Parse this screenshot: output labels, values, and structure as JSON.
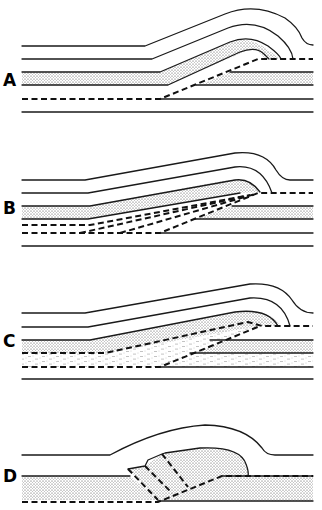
{
  "figure": {
    "type": "geological cross-section diagram",
    "panels": [
      {
        "id": "A",
        "label": "A",
        "description": "Fault-bend fold: stippled bed folded over a single ramp thrust (dashed)"
      },
      {
        "id": "B",
        "label": "B",
        "description": "Imbricate fan: multiple dashed thrust splays converging under stippled bed"
      },
      {
        "id": "C",
        "label": "C",
        "description": "Duplex: horses of dashed-pattern (shale) unit between roof and floor thrusts"
      },
      {
        "id": "D",
        "label": "D",
        "description": "Stippled thrust sheet with imbricate internal faults over a ramp"
      }
    ],
    "legend_patterns": {
      "stippled": "competent bed",
      "dashed_lines": "thrust fault",
      "short_dash_fill": "shale / duplex unit"
    },
    "colors": {
      "ink": "#1a1a1a",
      "background": "#ffffff"
    }
  }
}
